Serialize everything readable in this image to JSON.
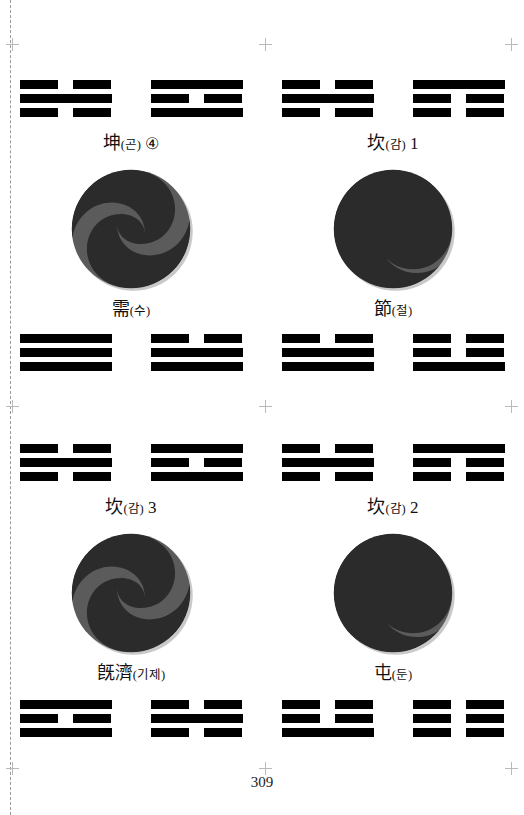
{
  "page": {
    "number": "309",
    "background": "#ffffff",
    "ink": "#000000"
  },
  "marks": {
    "dashed_line": "left-binding-dashed-line",
    "crop_mark_icon": "crosshair-registration-mark",
    "positions": [
      {
        "x": 12,
        "y": 38
      },
      {
        "x": 259,
        "y": 38
      },
      {
        "x": 505,
        "y": 38
      },
      {
        "x": 12,
        "y": 400
      },
      {
        "x": 259,
        "y": 400
      },
      {
        "x": 505,
        "y": 400
      },
      {
        "x": 12,
        "y": 762
      },
      {
        "x": 259,
        "y": 762
      },
      {
        "x": 505,
        "y": 762
      }
    ]
  },
  "taiji": {
    "dark_color": "#2b2b2b",
    "gray_color": "#5b5b5b",
    "shadow_color": "#c9c9c9",
    "name": "taijitu-spiral-disc"
  },
  "trigram_rows": [
    {
      "name": "row-top",
      "y": 80,
      "cells": [
        {
          "name": "trigram-kun",
          "lines": [
            "broken",
            "solid",
            "broken"
          ]
        },
        {
          "name": "trigram-kan",
          "lines": [
            "solid",
            "broken",
            "solid"
          ]
        },
        {
          "name": "trigram-kun-2",
          "lines": [
            "broken",
            "solid",
            "broken"
          ]
        },
        {
          "name": "trigram-kan-2",
          "lines": [
            "solid",
            "broken",
            "broken"
          ]
        }
      ]
    },
    {
      "name": "row-second",
      "y": 334,
      "cells": [
        {
          "name": "trigram-qian",
          "lines": [
            "solid",
            "solid",
            "solid"
          ]
        },
        {
          "name": "trigram-dui",
          "lines": [
            "broken",
            "solid",
            "solid"
          ]
        },
        {
          "name": "trigram-dui-2",
          "lines": [
            "broken",
            "solid",
            "solid"
          ]
        },
        {
          "name": "trigram-kan-3",
          "lines": [
            "broken",
            "broken",
            "solid"
          ]
        }
      ]
    },
    {
      "name": "row-third",
      "y": 444,
      "cells": [
        {
          "name": "trigram-kun-3",
          "lines": [
            "broken",
            "solid",
            "broken"
          ]
        },
        {
          "name": "trigram-kan-4",
          "lines": [
            "solid",
            "broken",
            "solid"
          ]
        },
        {
          "name": "trigram-kun-4",
          "lines": [
            "broken",
            "solid",
            "broken"
          ]
        },
        {
          "name": "trigram-kan-5",
          "lines": [
            "solid",
            "broken",
            "broken"
          ]
        }
      ]
    },
    {
      "name": "row-bottom",
      "y": 700,
      "cells": [
        {
          "name": "trigram-kan-6",
          "lines": [
            "solid",
            "broken",
            "solid"
          ]
        },
        {
          "name": "trigram-zhen",
          "lines": [
            "broken",
            "solid",
            "broken"
          ]
        },
        {
          "name": "trigram-gen",
          "lines": [
            "broken",
            "broken",
            "solid"
          ]
        },
        {
          "name": "trigram-kun-5",
          "lines": [
            "broken",
            "broken",
            "broken"
          ]
        }
      ]
    }
  ],
  "captions": {
    "top_left": {
      "han": "坤",
      "kor": "(곤)",
      "num": "④",
      "name": "caption-kun-4"
    },
    "top_right": {
      "han": "坎",
      "kor": "(감)",
      "num": "1",
      "name": "caption-kan-1"
    },
    "mid_left": {
      "han": "需",
      "kor": "(수)",
      "num": "",
      "name": "caption-xu"
    },
    "mid_right": {
      "han": "節",
      "kor": "(절)",
      "num": "",
      "name": "caption-jie"
    },
    "low_left": {
      "han": "坎",
      "kor": "(감)",
      "num": "3",
      "name": "caption-kan-3"
    },
    "low_right": {
      "han": "坎",
      "kor": "(감)",
      "num": "2",
      "name": "caption-kan-2"
    },
    "bot_left": {
      "han": "旣濟",
      "kor": "(기제)",
      "num": "",
      "name": "caption-jiji"
    },
    "bot_right": {
      "han": "屯",
      "kor": "(둔)",
      "num": "",
      "name": "caption-zhun"
    }
  },
  "taiji_discs": [
    {
      "name": "taijitu-upper-left",
      "orientation": "s-curve-right"
    },
    {
      "name": "taijitu-upper-right",
      "orientation": "s-curve-left"
    },
    {
      "name": "taijitu-lower-left",
      "orientation": "s-curve-right"
    },
    {
      "name": "taijitu-lower-right",
      "orientation": "s-curve-left"
    }
  ]
}
